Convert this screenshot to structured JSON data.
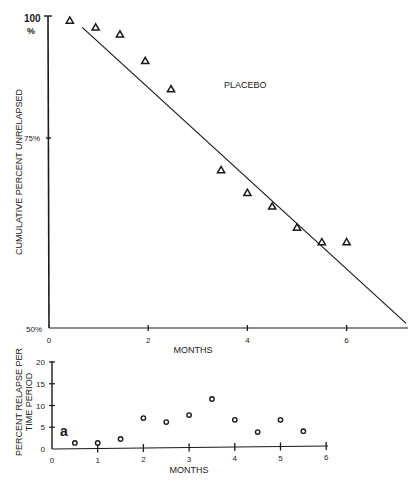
{
  "chart_data": [
    {
      "type": "scatter",
      "panel": "upper",
      "title": "",
      "annotation": "PLACEBO",
      "xlabel": "MONTHS",
      "ylabel": "CUMULATIVE PERCENT UNRELAPSED",
      "xlim": [
        0,
        7.2
      ],
      "ylim": [
        50,
        100
      ],
      "yscale": "log",
      "x_ticks": [
        "0",
        "2",
        "4",
        "6"
      ],
      "y_ticks": [
        "100 %",
        "75%",
        "50%"
      ],
      "grid": false,
      "series": [
        {
          "name": "Placebo (observed)",
          "marker": "triangle",
          "x": [
            0.42,
            0.94,
            1.43,
            1.94,
            2.46,
            3.47,
            4.0,
            4.5,
            5.0,
            5.5,
            6.0
          ],
          "y": [
            99,
            97.5,
            96,
            90.5,
            85,
            71,
            67.5,
            65.5,
            62.5,
            60.5,
            60.5
          ]
        },
        {
          "name": "Fitted line",
          "type": "line",
          "x": [
            0.67,
            7.2
          ],
          "y": [
            97.5,
            50.5
          ]
        }
      ]
    },
    {
      "type": "scatter",
      "panel": "lower",
      "title": "",
      "annotation": "a",
      "xlabel": "MONTHS",
      "ylabel": "PERCENT RELAPSE PER TIME PERIOD",
      "xlim": [
        0,
        6
      ],
      "ylim": [
        0,
        20
      ],
      "x_ticks": [
        "0",
        "1",
        "2",
        "3",
        "4",
        "5",
        "6"
      ],
      "y_ticks": [
        "0",
        "5",
        "10",
        "15",
        "20"
      ],
      "grid": false,
      "series": [
        {
          "name": "Percent relapse per time period",
          "marker": "circle",
          "x": [
            0.5,
            1.0,
            1.5,
            2.0,
            2.5,
            3.0,
            3.5,
            4.0,
            4.5,
            5.0,
            5.5
          ],
          "y": [
            1.4,
            1.4,
            2.3,
            7.1,
            6.2,
            7.8,
            11.5,
            6.7,
            3.9,
            6.7,
            4.1
          ]
        }
      ]
    }
  ],
  "upper": {
    "annotation": "PLACEBO",
    "xlabel": "MONTHS",
    "ylabel": "CUMULATIVE PERCENT UNRELAPSED",
    "y_tick_100": "100",
    "y_tick_100_unit": "%",
    "y_tick_75": "75%",
    "y_tick_50": "50%",
    "x_ticks": [
      "0",
      "2",
      "4",
      "6"
    ]
  },
  "lower": {
    "annotation": "a",
    "xlabel": "MONTHS",
    "ylabel_line1": "PERCENT RELAPSE PER",
    "ylabel_line2": "TIME PERIOD",
    "y_ticks": [
      "0",
      "5",
      "10",
      "15",
      "20"
    ],
    "x_ticks": [
      "0",
      "1",
      "2",
      "3",
      "4",
      "5",
      "6"
    ]
  },
  "colors": {
    "ink": "#1a1a1a",
    "background": "#ffffff"
  }
}
